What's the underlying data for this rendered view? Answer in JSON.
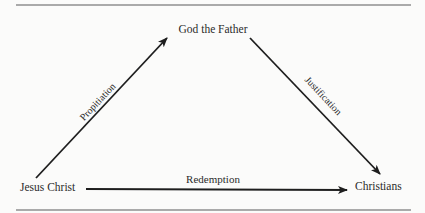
{
  "diagram": {
    "nodes": {
      "top": "God the Father",
      "left": "Jesus Christ",
      "right": "Christians"
    },
    "edges": {
      "left_to_top": "Propitiation",
      "top_to_right": "Justification",
      "left_to_right": "Redemption"
    },
    "colors": {
      "line": "#1e1e1e",
      "rule": "#555555",
      "background": "#fbfbfa",
      "text": "#2b2b2b"
    }
  }
}
